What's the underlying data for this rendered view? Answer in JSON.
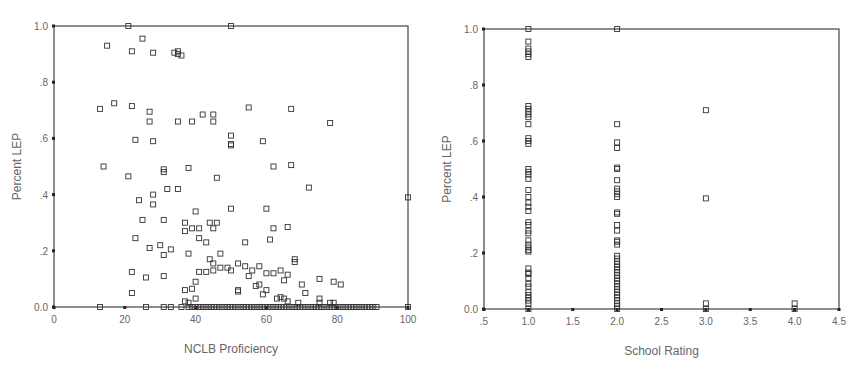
{
  "chart_data": [
    {
      "type": "scatter",
      "title": "",
      "xlabel": "NCLB Proficiency",
      "ylabel": "Percent LEP",
      "xlim": [
        0,
        100
      ],
      "ylim": [
        0,
        1.0
      ],
      "xticks": [
        "0",
        "20",
        "40",
        "60",
        "80",
        "100"
      ],
      "yticks": [
        "0.0",
        ".2",
        ".4",
        ".6",
        ".8",
        "1.0"
      ],
      "grid": false,
      "marker": "open-square",
      "points": [
        [
          21,
          1.0
        ],
        [
          50,
          1.0
        ],
        [
          15,
          0.93
        ],
        [
          25,
          0.955
        ],
        [
          22,
          0.91
        ],
        [
          28,
          0.905
        ],
        [
          35,
          0.91
        ],
        [
          35,
          0.9
        ],
        [
          34,
          0.905
        ],
        [
          36,
          0.895
        ],
        [
          13,
          0.705
        ],
        [
          17,
          0.725
        ],
        [
          22,
          0.715
        ],
        [
          27,
          0.695
        ],
        [
          27,
          0.66
        ],
        [
          35,
          0.66
        ],
        [
          39,
          0.66
        ],
        [
          42,
          0.685
        ],
        [
          45,
          0.685
        ],
        [
          45,
          0.66
        ],
        [
          55,
          0.71
        ],
        [
          67,
          0.705
        ],
        [
          78,
          0.655
        ],
        [
          23,
          0.595
        ],
        [
          28,
          0.59
        ],
        [
          50,
          0.61
        ],
        [
          59,
          0.59
        ],
        [
          14,
          0.5
        ],
        [
          21,
          0.465
        ],
        [
          31,
          0.49
        ],
        [
          31,
          0.48
        ],
        [
          38,
          0.495
        ],
        [
          50,
          0.58
        ],
        [
          50,
          0.575
        ],
        [
          62,
          0.5
        ],
        [
          67,
          0.505
        ],
        [
          46,
          0.46
        ],
        [
          72,
          0.425
        ],
        [
          24,
          0.38
        ],
        [
          28,
          0.4
        ],
        [
          32,
          0.42
        ],
        [
          35,
          0.42
        ],
        [
          28,
          0.365
        ],
        [
          40,
          0.34
        ],
        [
          25,
          0.31
        ],
        [
          31,
          0.31
        ],
        [
          37,
          0.3
        ],
        [
          39,
          0.28
        ],
        [
          41,
          0.28
        ],
        [
          44,
          0.3
        ],
        [
          45,
          0.28
        ],
        [
          46,
          0.3
        ],
        [
          50,
          0.35
        ],
        [
          60,
          0.35
        ],
        [
          66,
          0.285
        ],
        [
          23,
          0.245
        ],
        [
          27,
          0.21
        ],
        [
          30,
          0.22
        ],
        [
          31,
          0.185
        ],
        [
          33,
          0.205
        ],
        [
          37,
          0.27
        ],
        [
          38,
          0.19
        ],
        [
          41,
          0.245
        ],
        [
          43,
          0.23
        ],
        [
          44,
          0.17
        ],
        [
          45,
          0.155
        ],
        [
          47,
          0.19
        ],
        [
          54,
          0.23
        ],
        [
          61,
          0.24
        ],
        [
          62,
          0.28
        ],
        [
          68,
          0.17
        ],
        [
          68,
          0.16
        ],
        [
          22,
          0.125
        ],
        [
          26,
          0.105
        ],
        [
          31,
          0.11
        ],
        [
          37,
          0.06
        ],
        [
          39,
          0.065
        ],
        [
          40,
          0.09
        ],
        [
          41,
          0.125
        ],
        [
          43,
          0.125
        ],
        [
          45,
          0.13
        ],
        [
          47,
          0.14
        ],
        [
          49,
          0.14
        ],
        [
          50,
          0.13
        ],
        [
          52,
          0.155
        ],
        [
          54,
          0.145
        ],
        [
          55,
          0.11
        ],
        [
          56,
          0.13
        ],
        [
          58,
          0.145
        ],
        [
          60,
          0.12
        ],
        [
          62,
          0.12
        ],
        [
          64,
          0.13
        ],
        [
          65,
          0.095
        ],
        [
          66,
          0.115
        ],
        [
          70,
          0.08
        ],
        [
          71,
          0.05
        ],
        [
          75,
          0.1
        ],
        [
          79,
          0.09
        ],
        [
          81,
          0.08
        ],
        [
          22,
          0.05
        ],
        [
          37,
          0.02
        ],
        [
          38,
          0.015
        ],
        [
          40,
          0.03
        ],
        [
          52,
          0.06
        ],
        [
          52,
          0.055
        ],
        [
          57,
          0.075
        ],
        [
          58,
          0.08
        ],
        [
          59,
          0.045
        ],
        [
          60,
          0.06
        ],
        [
          63,
          0.03
        ],
        [
          64,
          0.035
        ],
        [
          65,
          0.03
        ],
        [
          66,
          0.02
        ],
        [
          69,
          0.015
        ],
        [
          75,
          0.03
        ],
        [
          75,
          0.015
        ],
        [
          78,
          0.015
        ],
        [
          79,
          0.015
        ],
        [
          100,
          0.39
        ],
        [
          100,
          0.0
        ],
        [
          13,
          0.0
        ],
        [
          26,
          0.0
        ],
        [
          31,
          0.0
        ],
        [
          33,
          0.0
        ],
        [
          36,
          0.0
        ]
      ],
      "dense_zero_band": {
        "x_range": [
          38,
          92
        ],
        "y": 0.0,
        "note": "many overlapping points along 0.0"
      }
    },
    {
      "type": "scatter",
      "title": "",
      "xlabel": "School Rating",
      "ylabel": "Percent LEP",
      "xlim": [
        0.5,
        4.5
      ],
      "ylim": [
        0,
        1.0
      ],
      "xticks": [
        ".5",
        "1.0",
        "1.5",
        "2.0",
        "2.5",
        "3.0",
        "3.5",
        "4.0",
        "4.5"
      ],
      "yticks": [
        "0.0",
        ".2",
        ".4",
        ".6",
        ".8",
        "1.0"
      ],
      "grid": false,
      "marker": "open-square",
      "points": [
        [
          1.0,
          1.0
        ],
        [
          1.0,
          0.955
        ],
        [
          1.0,
          0.93
        ],
        [
          1.0,
          0.92
        ],
        [
          1.0,
          0.91
        ],
        [
          1.0,
          0.9
        ],
        [
          1.0,
          0.725
        ],
        [
          1.0,
          0.715
        ],
        [
          1.0,
          0.705
        ],
        [
          1.0,
          0.695
        ],
        [
          1.0,
          0.685
        ],
        [
          1.0,
          0.66
        ],
        [
          1.0,
          0.61
        ],
        [
          1.0,
          0.6
        ],
        [
          1.0,
          0.59
        ],
        [
          1.0,
          0.5
        ],
        [
          1.0,
          0.49
        ],
        [
          1.0,
          0.48
        ],
        [
          1.0,
          0.465
        ],
        [
          1.0,
          0.425
        ],
        [
          1.0,
          0.4
        ],
        [
          1.0,
          0.38
        ],
        [
          1.0,
          0.365
        ],
        [
          1.0,
          0.35
        ],
        [
          1.0,
          0.31
        ],
        [
          1.0,
          0.3
        ],
        [
          1.0,
          0.28
        ],
        [
          1.0,
          0.27
        ],
        [
          1.0,
          0.245
        ],
        [
          1.0,
          0.23
        ],
        [
          1.0,
          0.22
        ],
        [
          1.0,
          0.21
        ],
        [
          1.0,
          0.205
        ],
        [
          1.0,
          0.145
        ],
        [
          1.0,
          0.13
        ],
        [
          1.0,
          0.125
        ],
        [
          1.0,
          0.11
        ],
        [
          1.0,
          0.09
        ],
        [
          1.0,
          0.08
        ],
        [
          1.0,
          0.06
        ],
        [
          1.0,
          0.05
        ],
        [
          1.0,
          0.04
        ],
        [
          1.0,
          0.03
        ],
        [
          1.0,
          0.02
        ],
        [
          1.0,
          0.0
        ],
        [
          2.0,
          1.0
        ],
        [
          2.0,
          0.66
        ],
        [
          2.0,
          0.595
        ],
        [
          2.0,
          0.575
        ],
        [
          2.0,
          0.505
        ],
        [
          2.0,
          0.5
        ],
        [
          2.0,
          0.46
        ],
        [
          2.0,
          0.43
        ],
        [
          2.0,
          0.42
        ],
        [
          2.0,
          0.41
        ],
        [
          2.0,
          0.4
        ],
        [
          2.0,
          0.345
        ],
        [
          2.0,
          0.34
        ],
        [
          2.0,
          0.3
        ],
        [
          2.0,
          0.28
        ],
        [
          2.0,
          0.245
        ],
        [
          2.0,
          0.24
        ],
        [
          2.0,
          0.23
        ],
        [
          2.0,
          0.19
        ],
        [
          2.0,
          0.18
        ],
        [
          2.0,
          0.17
        ],
        [
          2.0,
          0.16
        ],
        [
          2.0,
          0.15
        ],
        [
          2.0,
          0.14
        ],
        [
          2.0,
          0.13
        ],
        [
          2.0,
          0.12
        ],
        [
          2.0,
          0.11
        ],
        [
          2.0,
          0.1
        ],
        [
          2.0,
          0.09
        ],
        [
          2.0,
          0.08
        ],
        [
          2.0,
          0.07
        ],
        [
          2.0,
          0.06
        ],
        [
          2.0,
          0.05
        ],
        [
          2.0,
          0.04
        ],
        [
          2.0,
          0.03
        ],
        [
          2.0,
          0.02
        ],
        [
          2.0,
          0.01
        ],
        [
          2.0,
          0.0
        ],
        [
          3.0,
          0.71
        ],
        [
          3.0,
          0.395
        ],
        [
          3.0,
          0.02
        ],
        [
          3.0,
          0.0
        ],
        [
          4.0,
          0.02
        ],
        [
          4.0,
          0.0
        ]
      ]
    }
  ],
  "charts": [
    {
      "xlabel": "NCLB Proficiency",
      "ylabel": "Percent LEP"
    },
    {
      "xlabel": "School Rating",
      "ylabel": "Percent LEP"
    }
  ]
}
